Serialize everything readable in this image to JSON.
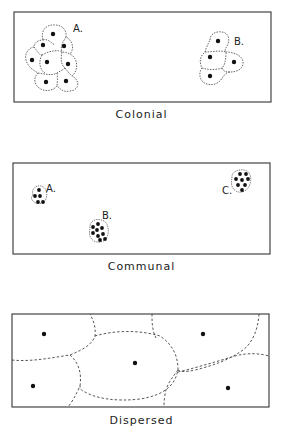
{
  "panels": [
    {
      "id": "colonial",
      "caption": "Colonial",
      "labels": [
        "A.",
        "B."
      ]
    },
    {
      "id": "communal",
      "caption": "Communal",
      "labels": [
        "A.",
        "B.",
        "C."
      ]
    },
    {
      "id": "dispersed",
      "caption": "Dispersed",
      "labels": []
    }
  ],
  "colors": {
    "ink": "#222222",
    "background": "#ffffff"
  }
}
